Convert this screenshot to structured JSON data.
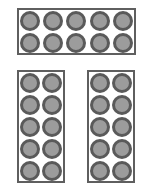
{
  "diagram": {
    "colors": {
      "frame_border": "#5f5f5f",
      "well_ring": "#5a5a5a",
      "well_fill": "#9c9c9c",
      "background": "#ffffff"
    },
    "panels": [
      {
        "id": "top",
        "orientation": "horizontal",
        "columns": 5,
        "rows": 2,
        "well_count": 10
      },
      {
        "id": "bottom-left",
        "orientation": "vertical",
        "columns": 2,
        "rows": 5,
        "well_count": 10
      },
      {
        "id": "bottom-right",
        "orientation": "vertical",
        "columns": 2,
        "rows": 5,
        "well_count": 10
      }
    ],
    "total_wells": 30
  }
}
